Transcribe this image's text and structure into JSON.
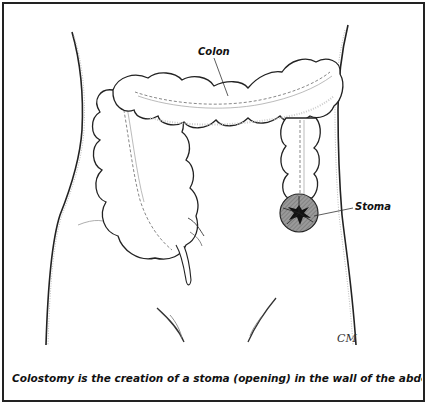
{
  "figure": {
    "labels": {
      "colon": "Colon",
      "stoma": "Stoma"
    },
    "signature": "CM",
    "caption": "Colostomy is the creation of a stoma (opening) in the wall of the abdomen to which"
  },
  "colors": {
    "line": "#222222",
    "shading": "#9a9a9a",
    "stoma_fill": "#8c8c8c",
    "stoma_center": "#111111",
    "background": "#ffffff"
  }
}
